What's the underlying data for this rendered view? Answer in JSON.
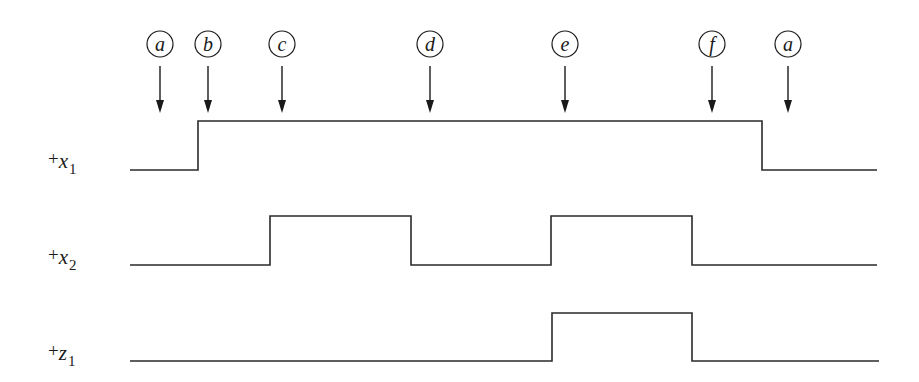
{
  "diagram": {
    "type": "timing-diagram",
    "markers": [
      {
        "id": "m1",
        "label": "a",
        "x": 160
      },
      {
        "id": "m2",
        "label": "b",
        "x": 208
      },
      {
        "id": "m3",
        "label": "c",
        "x": 282
      },
      {
        "id": "m4",
        "label": "d",
        "x": 430
      },
      {
        "id": "m5",
        "label": "e",
        "x": 565
      },
      {
        "id": "m6",
        "label": "f",
        "x": 712
      },
      {
        "id": "m7",
        "label": "a",
        "x": 788
      }
    ],
    "signals": [
      {
        "name": "x1",
        "prefix": "+",
        "var": "x",
        "sub": "1",
        "label_y": 170,
        "levels": {
          "low_y": 170,
          "high_y": 121
        },
        "x_start": 130,
        "x_end": 877,
        "transitions": [
          198,
          762
        ],
        "initial": 0,
        "states_by_marker": {
          "a": 0,
          "b": 1,
          "c": 1,
          "d": 1,
          "e": 1,
          "f": 1,
          "a_final": 0
        }
      },
      {
        "name": "x2",
        "prefix": "+",
        "var": "x",
        "sub": "2",
        "label_y": 266,
        "levels": {
          "low_y": 265,
          "high_y": 216
        },
        "x_start": 130,
        "x_end": 877,
        "transitions": [
          270,
          411,
          551,
          692
        ],
        "initial": 0,
        "states_by_marker": {
          "a": 0,
          "b": 0,
          "c": 1,
          "d": 0,
          "e": 1,
          "f": 0,
          "a_final": 0
        }
      },
      {
        "name": "z1",
        "prefix": "+",
        "var": "z",
        "sub": "1",
        "label_y": 362,
        "levels": {
          "low_y": 361,
          "high_y": 313
        },
        "x_start": 130,
        "x_end": 879,
        "transitions": [
          552,
          692
        ],
        "initial": 0,
        "states_by_marker": {
          "a": 0,
          "b": 0,
          "c": 0,
          "d": 0,
          "e": 1,
          "f": 0,
          "a_final": 0
        }
      }
    ]
  }
}
